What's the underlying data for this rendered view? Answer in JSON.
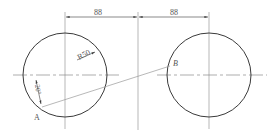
{
  "diagram": {
    "type": "technical-drawing",
    "colors": {
      "outline": "#3a3a3a",
      "thin_line": "#9a9a9a",
      "text": "#555555"
    },
    "dimensions": {
      "left_spacing": "88",
      "right_spacing": "88",
      "radius": "R50",
      "angle": "20°"
    },
    "points": {
      "a": "A",
      "b": "B"
    },
    "circles": [
      {
        "name": "left-circle",
        "cx": 65,
        "cy": 75,
        "r": 42
      },
      {
        "name": "right-circle",
        "cx": 209,
        "cy": 75,
        "r": 42
      }
    ]
  }
}
